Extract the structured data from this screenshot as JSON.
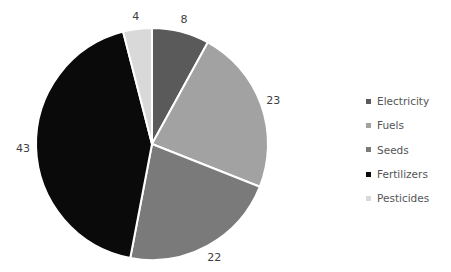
{
  "chart_data": {
    "type": "pie",
    "title": "",
    "categories": [
      "Electricity",
      "Fuels",
      "Seeds",
      "Fertilizers",
      "Pesticides"
    ],
    "values": [
      8,
      23,
      22,
      43,
      4
    ],
    "colors": [
      "#5a5a5a",
      "#a2a2a2",
      "#7a7a7a",
      "#0a0a0a",
      "#d9d9d9"
    ],
    "data_labels": [
      "8",
      "23",
      "22",
      "43",
      "4"
    ],
    "start_angle_deg": 0,
    "direction": "clockwise",
    "legend_position": "right"
  },
  "legend": {
    "items": [
      {
        "label": "Electricity",
        "color": "#5a5a5a"
      },
      {
        "label": "Fuels",
        "color": "#a2a2a2"
      },
      {
        "label": "Seeds",
        "color": "#7a7a7a"
      },
      {
        "label": "Fertilizers",
        "color": "#0a0a0a"
      },
      {
        "label": "Pesticides",
        "color": "#d9d9d9"
      }
    ]
  }
}
